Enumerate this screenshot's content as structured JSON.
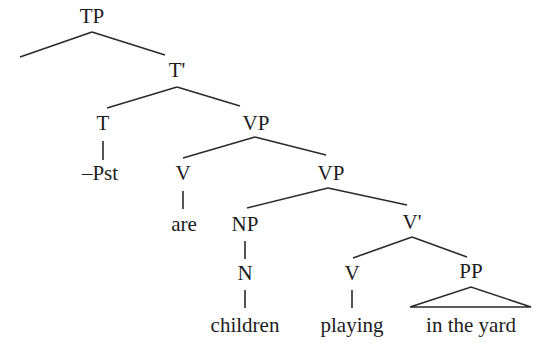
{
  "diagram": {
    "type": "syntax-tree",
    "nodes": [
      {
        "id": "tp",
        "label": "TP",
        "x": 92,
        "y": 6
      },
      {
        "id": "tbar",
        "label": "T'",
        "x": 176,
        "y": 60
      },
      {
        "id": "t",
        "label": "T",
        "x": 104,
        "y": 112
      },
      {
        "id": "vp1",
        "label": "VP",
        "x": 256,
        "y": 112
      },
      {
        "id": "pst",
        "label": "–Pst",
        "x": 101,
        "y": 163
      },
      {
        "id": "v1",
        "label": "V",
        "x": 183,
        "y": 163
      },
      {
        "id": "vp2",
        "label": "VP",
        "x": 330,
        "y": 163
      },
      {
        "id": "are",
        "label": "are",
        "x": 183,
        "y": 214
      },
      {
        "id": "np",
        "label": "NP",
        "x": 245,
        "y": 214
      },
      {
        "id": "vbar",
        "label": "V'",
        "x": 411,
        "y": 212
      },
      {
        "id": "n",
        "label": "N",
        "x": 245,
        "y": 263
      },
      {
        "id": "v2",
        "label": "V",
        "x": 351,
        "y": 263
      },
      {
        "id": "pp",
        "label": "PP",
        "x": 471,
        "y": 263
      },
      {
        "id": "children",
        "label": "children",
        "x": 245,
        "y": 316
      },
      {
        "id": "playing",
        "label": "playing",
        "x": 351,
        "y": 316
      },
      {
        "id": "inTheYard",
        "label": "in the yard",
        "x": 471,
        "y": 316
      }
    ],
    "edges": [
      {
        "from": "tp",
        "to": "(empty-specifier)"
      },
      {
        "from": "tp",
        "to": "tbar"
      },
      {
        "from": "tbar",
        "to": "t"
      },
      {
        "from": "tbar",
        "to": "vp1"
      },
      {
        "from": "t",
        "to": "pst"
      },
      {
        "from": "vp1",
        "to": "v1"
      },
      {
        "from": "vp1",
        "to": "vp2"
      },
      {
        "from": "v1",
        "to": "are"
      },
      {
        "from": "vp2",
        "to": "np"
      },
      {
        "from": "vp2",
        "to": "vbar"
      },
      {
        "from": "np",
        "to": "n"
      },
      {
        "from": "n",
        "to": "children"
      },
      {
        "from": "vbar",
        "to": "v2"
      },
      {
        "from": "vbar",
        "to": "pp"
      },
      {
        "from": "v2",
        "to": "playing"
      },
      {
        "from": "pp",
        "to": "inTheYard",
        "style": "triangle"
      }
    ]
  },
  "labels": {
    "tp": "TP",
    "tbar": "T'",
    "t": "T",
    "vp1": "VP",
    "pst": "–Pst",
    "v1": "V",
    "vp2": "VP",
    "are": "are",
    "np": "NP",
    "vbar": "V'",
    "n": "N",
    "v2": "V",
    "pp": "PP",
    "children": "children",
    "playing": "playing",
    "inTheYard": "in the yard"
  }
}
